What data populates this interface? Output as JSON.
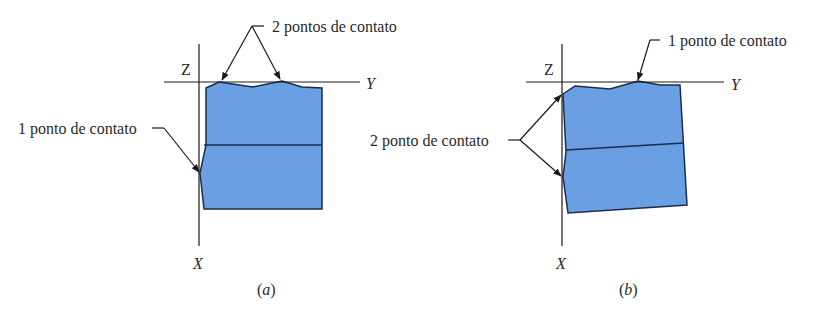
{
  "figure": {
    "colors": {
      "block_fill": "#6a9fe3",
      "block_stroke": "#1a2d4a",
      "line": "#1a1a1a",
      "text": "#2a2a2a",
      "background": "#ffffff"
    },
    "panels": [
      {
        "id": "a",
        "caption_open": "(",
        "caption_letter": "a",
        "caption_close": ")",
        "axes": {
          "z": "Z",
          "y": "Y",
          "x": "X"
        },
        "callouts": [
          {
            "label": "2 pontos de contato",
            "target": "top edge",
            "count": 2
          },
          {
            "label": "1 ponto de contato",
            "target": "left edge",
            "count": 1
          }
        ]
      },
      {
        "id": "b",
        "caption_open": "(",
        "caption_letter": "b",
        "caption_close": ")",
        "axes": {
          "z": "Z",
          "y": "Y",
          "x": "X"
        },
        "callouts": [
          {
            "label": "1 ponto de contato",
            "target": "top edge",
            "count": 1
          },
          {
            "label": "2 ponto de contato",
            "target": "left edge",
            "count": 2
          }
        ]
      }
    ]
  }
}
